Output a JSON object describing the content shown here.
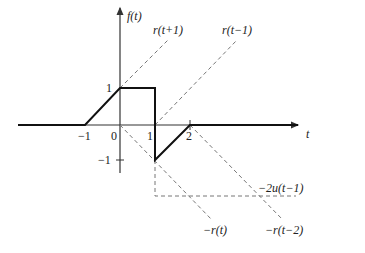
{
  "diagram": {
    "type": "signal-decomposition-plot",
    "axes": {
      "y_label": "f(t)",
      "x_label": "t",
      "x_ticks": [
        "−1",
        "0",
        "1",
        "2"
      ],
      "y_ticks": [
        "1",
        "−1"
      ]
    },
    "signal": {
      "name": "f(t)",
      "points": [
        [
          -3,
          0
        ],
        [
          -1,
          0
        ],
        [
          0,
          1
        ],
        [
          1,
          1
        ],
        [
          1,
          -1
        ],
        [
          2,
          0
        ],
        [
          5,
          0
        ]
      ]
    },
    "components": [
      {
        "label": "r(t+1)",
        "style": "dashed"
      },
      {
        "label": "r(t−1)",
        "style": "dashed"
      },
      {
        "label": "−2u(t−1)",
        "style": "dashed"
      },
      {
        "label": "−r(t)",
        "style": "dashed"
      },
      {
        "label": "−r(t−2)",
        "style": "dashed"
      }
    ],
    "colors": {
      "signal": "#111111",
      "axis": "#333333",
      "dashed": "#777777"
    }
  }
}
